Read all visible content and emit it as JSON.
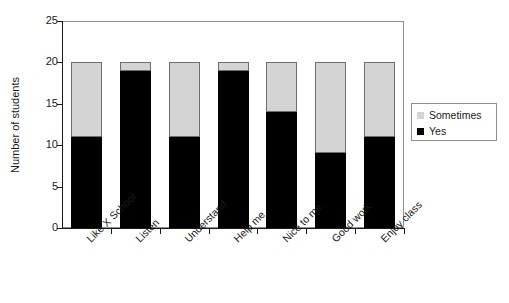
{
  "chart_data": {
    "type": "bar",
    "subtype": "stacked-bar",
    "title": "",
    "xlabel": "",
    "ylabel": "Number of students",
    "ylim": [
      0,
      25
    ],
    "ytick_step": 5,
    "yticks": [
      0,
      5,
      10,
      15,
      20,
      25
    ],
    "ytick_labels": [
      "0",
      "5",
      "10",
      "15",
      "20",
      "25"
    ],
    "grid": false,
    "legend_position": "right",
    "categories": [
      "Like X School",
      "Listen",
      "Understand",
      "Help me",
      "Nice to me",
      "Good work",
      "Enjoy class"
    ],
    "series": [
      {
        "name": "Yes",
        "color": "#000000",
        "values": [
          11,
          19,
          11,
          19,
          14,
          9,
          11
        ]
      },
      {
        "name": "Sometimes",
        "color": "#d4d4d4",
        "values": [
          9,
          1,
          9,
          1,
          6,
          11,
          9
        ]
      }
    ],
    "stack_order_bottom_to_top": [
      "Yes",
      "Sometimes"
    ],
    "bar_totals": [
      20,
      20,
      20,
      20,
      20,
      20,
      20
    ]
  },
  "legend": {
    "entries": [
      {
        "label": "Sometimes",
        "swatch": "sw-sometimes"
      },
      {
        "label": "Yes",
        "swatch": "sw-yes"
      }
    ]
  },
  "axes": {
    "y_title": "Number of students"
  }
}
